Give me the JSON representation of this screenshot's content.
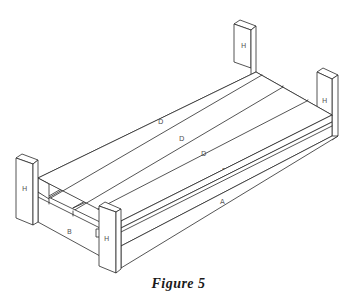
{
  "figure": {
    "caption": "Figure 5",
    "parts": {
      "posts": [
        "H",
        "H",
        "H",
        "H"
      ],
      "deck_boards": [
        "D",
        "D",
        "D",
        "D"
      ],
      "side_rail": "A",
      "end_rail": "B"
    }
  }
}
